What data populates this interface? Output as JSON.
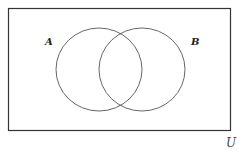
{
  "diagram": {
    "type": "venn",
    "universe_label": "U",
    "sets": [
      {
        "label": "A"
      },
      {
        "label": "B"
      }
    ],
    "colors": {
      "stroke": "#333333",
      "background": "#ffffff"
    }
  }
}
